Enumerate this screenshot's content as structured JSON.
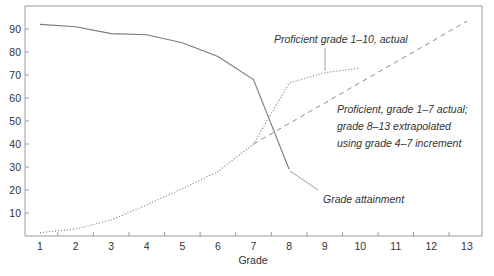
{
  "chart_data": {
    "type": "line",
    "title": "",
    "xlabel": "Grade",
    "ylabel": "",
    "x": [
      1,
      2,
      3,
      4,
      5,
      6,
      7,
      8,
      9,
      10,
      11,
      12,
      13
    ],
    "xlim": [
      1,
      13
    ],
    "ylim": [
      0,
      100
    ],
    "yticks": [
      10,
      20,
      30,
      40,
      50,
      60,
      70,
      80,
      90
    ],
    "xticks": [
      1,
      2,
      3,
      4,
      5,
      6,
      7,
      8,
      9,
      10,
      11,
      12,
      13
    ],
    "grid": false,
    "legend": "inline annotations",
    "series": [
      {
        "name": "Grade attainment",
        "style": "solid",
        "x": [
          1,
          2,
          3,
          4,
          5,
          6,
          7,
          8
        ],
        "values": [
          92,
          91,
          88,
          87.5,
          84,
          78,
          68,
          29
        ]
      },
      {
        "name": "Proficient grade 1–10, actual",
        "style": "dotted",
        "x": [
          1,
          2,
          3,
          4,
          5,
          6,
          7,
          8,
          9,
          10
        ],
        "values": [
          1.5,
          3,
          7,
          13.5,
          20.5,
          28,
          40,
          66.5,
          71,
          73
        ]
      },
      {
        "name": "Proficient, grade 1–7 actual; grade 8–13 extrapolated using grade 4–7 increment",
        "style": "dashed",
        "x": [
          7,
          8,
          9,
          10,
          11,
          12,
          13
        ],
        "values": [
          40,
          48.9,
          57.8,
          66.7,
          75.6,
          84.5,
          93.5
        ]
      }
    ],
    "annotations": [
      {
        "text": "Proficient grade 1–10, actual",
        "target_series": 1
      },
      {
        "lines": [
          "Proficient, grade 1–7 actual;",
          "grade 8–13 extrapolated",
          "using grade 4–7 increment"
        ],
        "target_series": 2
      },
      {
        "text": "Grade attainment",
        "target_series": 0
      }
    ]
  },
  "labels": {
    "xlabel": "Grade",
    "annot_actual": "Proficient grade 1–10, actual",
    "annot_extrap_1": "Proficient, grade 1–7 actual;",
    "annot_extrap_2": "grade 8–13 extrapolated",
    "annot_extrap_3": "using grade 4–7 increment",
    "annot_attain": "Grade attainment"
  }
}
